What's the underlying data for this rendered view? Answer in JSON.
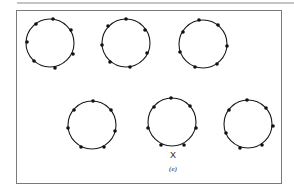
{
  "figure": {
    "panel_label": "(e)",
    "marker_label": "X",
    "stroke_color": "#1a1a1a",
    "frame_color": "#7a7a7a",
    "circles": [
      {
        "cx": 50,
        "cy": 43,
        "r": 24,
        "dots": 7
      },
      {
        "cx": 126,
        "cy": 43,
        "r": 24,
        "dots": 7
      },
      {
        "cx": 203,
        "cy": 44,
        "r": 24,
        "dots": 7
      },
      {
        "cx": 92,
        "cy": 125,
        "r": 24,
        "dots": 7
      },
      {
        "cx": 172,
        "cy": 122,
        "r": 24,
        "dots": 7
      },
      {
        "cx": 248,
        "cy": 124,
        "r": 24,
        "dots": 7
      }
    ]
  }
}
